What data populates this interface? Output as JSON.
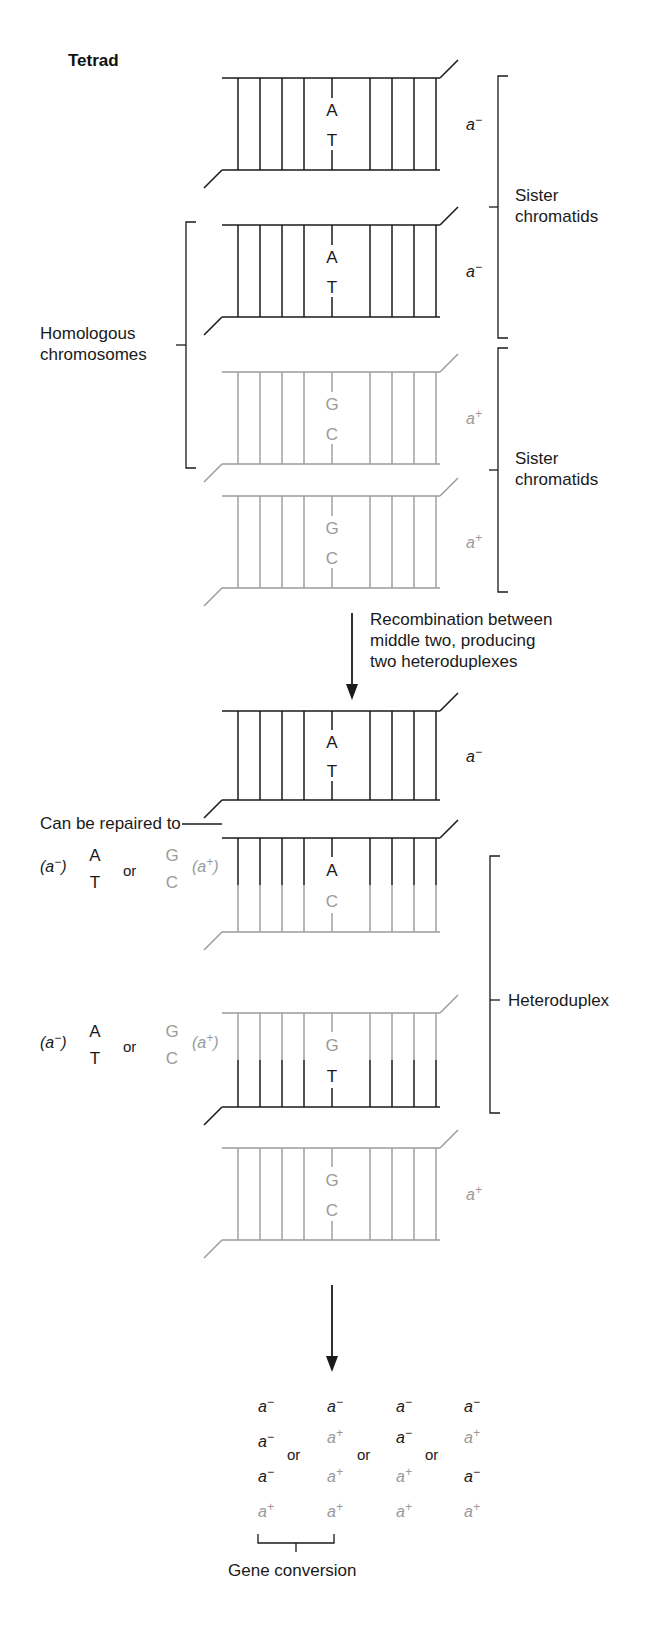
{
  "figure": {
    "title": "Tetrad",
    "type": "meiotic recombination / gene conversion diagram"
  },
  "labels": {
    "tetrad": "Tetrad",
    "sister_chromatids_top": "Sister\nchromatids",
    "sister_chromatids_top_line1": "Sister",
    "sister_chromatids_top_line2": "chromatids",
    "sister_chromatids_bottom_line1": "Sister",
    "sister_chromatids_bottom_line2": "chromatids",
    "homologous_line1": "Homologous",
    "homologous_line2": "chromosomes",
    "recombination_line1": "Recombination between",
    "recombination_line2": "middle two, producing",
    "recombination_line3": "two heteroduplexes",
    "can_be_repaired_to": "Can be repaired to",
    "heteroduplex": "Heteroduplex",
    "gene_conversion": "Gene conversion",
    "or": "or"
  },
  "stage_top": {
    "caption": "Tetrad — four chromatids before recombination",
    "duplexes": [
      {
        "id": "t1",
        "top_base": "A",
        "bottom_base": "T",
        "allele": "a",
        "allele_sign": "−",
        "color": "black"
      },
      {
        "id": "t2",
        "top_base": "A",
        "bottom_base": "T",
        "allele": "a",
        "allele_sign": "−",
        "color": "black"
      },
      {
        "id": "t3",
        "top_base": "G",
        "bottom_base": "C",
        "allele": "a",
        "allele_sign": "+",
        "color": "gray"
      },
      {
        "id": "t4",
        "top_base": "G",
        "bottom_base": "C",
        "allele": "a",
        "allele_sign": "+",
        "color": "gray"
      }
    ]
  },
  "stage_bottom": {
    "caption": "After recombination — two heteroduplexes formed",
    "duplexes": [
      {
        "id": "b1",
        "top_base": "A",
        "bottom_base": "T",
        "allele": "a",
        "allele_sign": "−",
        "top_color": "black",
        "bottom_color": "black"
      },
      {
        "id": "b2",
        "top_base": "A",
        "bottom_base": "C",
        "allele": "",
        "allele_sign": "",
        "top_color": "black",
        "bottom_color": "gray"
      },
      {
        "id": "b3",
        "top_base": "G",
        "bottom_base": "T",
        "allele": "",
        "allele_sign": "",
        "top_color": "gray",
        "bottom_color": "black"
      },
      {
        "id": "b4",
        "top_base": "G",
        "bottom_base": "C",
        "allele": "a",
        "allele_sign": "+",
        "top_color": "gray",
        "bottom_color": "gray"
      }
    ]
  },
  "repair_options": [
    {
      "left_allele": "a",
      "left_sign": "−",
      "left_top": "A",
      "left_bottom": "T",
      "or": "or",
      "right_top": "G",
      "right_bottom": "C",
      "right_allele": "a",
      "right_sign": "+"
    },
    {
      "left_allele": "a",
      "left_sign": "−",
      "left_top": "A",
      "left_bottom": "T",
      "or": "or",
      "right_top": "G",
      "right_bottom": "C",
      "right_allele": "a",
      "right_sign": "+"
    }
  ],
  "gene_conversion_grid": {
    "separator": "or",
    "columns": [
      {
        "cells": [
          {
            "allele": "a",
            "sign": "−",
            "color": "black"
          },
          {
            "allele": "a",
            "sign": "−",
            "color": "black"
          },
          {
            "allele": "a",
            "sign": "−",
            "color": "black"
          },
          {
            "allele": "a",
            "sign": "+",
            "color": "gray"
          }
        ]
      },
      {
        "cells": [
          {
            "allele": "a",
            "sign": "−",
            "color": "black"
          },
          {
            "allele": "a",
            "sign": "+",
            "color": "gray"
          },
          {
            "allele": "a",
            "sign": "+",
            "color": "gray"
          },
          {
            "allele": "a",
            "sign": "+",
            "color": "gray"
          }
        ]
      },
      {
        "cells": [
          {
            "allele": "a",
            "sign": "−",
            "color": "black"
          },
          {
            "allele": "a",
            "sign": "−",
            "color": "black"
          },
          {
            "allele": "a",
            "sign": "+",
            "color": "gray"
          },
          {
            "allele": "a",
            "sign": "+",
            "color": "gray"
          }
        ]
      },
      {
        "cells": [
          {
            "allele": "a",
            "sign": "−",
            "color": "black"
          },
          {
            "allele": "a",
            "sign": "+",
            "color": "gray"
          },
          {
            "allele": "a",
            "sign": "−",
            "color": "black"
          },
          {
            "allele": "a",
            "sign": "+",
            "color": "gray"
          }
        ]
      }
    ]
  },
  "colors": {
    "black_strand": "#1a1a1a",
    "gray_strand": "#9a9a9a",
    "background": "#ffffff"
  }
}
